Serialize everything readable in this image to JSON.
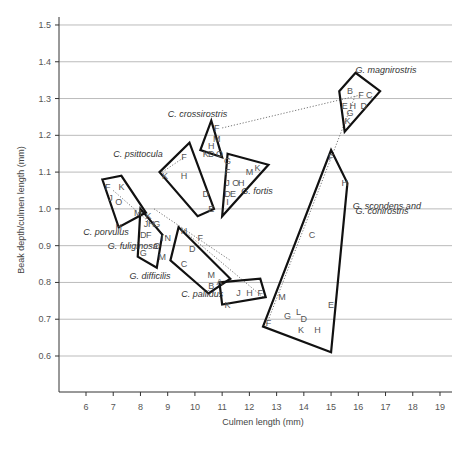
{
  "chart_data": {
    "type": "scatter",
    "title": "",
    "xlabel": "Culmen length (mm)",
    "ylabel": "Beak depth/culmen length (mm)",
    "xlim": [
      5.0,
      19.3
    ],
    "ylim": [
      0.5,
      1.52
    ],
    "x_ticks": [
      "6",
      "7",
      "8",
      "9",
      "10",
      "11",
      "12",
      "13",
      "14",
      "15",
      "16",
      "17",
      "18",
      "19"
    ],
    "y_ticks": [
      "0.6",
      "0.7",
      "0.8",
      "0.9",
      "1.0",
      "1.1",
      "1.2",
      "1.3",
      "1.4",
      "1.5"
    ],
    "grid": "horizontal",
    "series": [
      {
        "name": "G. magnirostris",
        "hull": [
          [
            15.3,
            1.32
          ],
          [
            15.9,
            1.37
          ],
          [
            16.8,
            1.32
          ],
          [
            15.5,
            1.21
          ]
        ],
        "points": [
          {
            "l": "B",
            "x": 15.7,
            "y": 1.32
          },
          {
            "l": "F",
            "x": 16.1,
            "y": 1.31
          },
          {
            "l": "C",
            "x": 16.4,
            "y": 1.31
          },
          {
            "l": "E",
            "x": 15.5,
            "y": 1.28
          },
          {
            "l": "H",
            "x": 15.8,
            "y": 1.28
          },
          {
            "l": "D",
            "x": 16.2,
            "y": 1.28
          },
          {
            "l": "G",
            "x": 15.7,
            "y": 1.26
          },
          {
            "l": "K",
            "x": 15.6,
            "y": 1.24
          }
        ]
      },
      {
        "name": "C. crossirostris",
        "hull": [
          [
            10.6,
            1.24
          ],
          [
            11.0,
            1.14
          ],
          [
            10.2,
            1.16
          ]
        ],
        "points": [
          {
            "l": "F",
            "x": 10.8,
            "y": 1.22
          },
          {
            "l": "M",
            "x": 10.8,
            "y": 1.19
          },
          {
            "l": "H",
            "x": 10.6,
            "y": 1.17
          },
          {
            "l": "K",
            "x": 10.4,
            "y": 1.15
          },
          {
            "l": "D",
            "x": 10.6,
            "y": 1.15
          },
          {
            "l": "O",
            "x": 10.9,
            "y": 1.15
          }
        ]
      },
      {
        "name": "C. psittocula",
        "hull": [
          [
            8.7,
            1.1
          ],
          [
            9.8,
            1.18
          ],
          [
            10.7,
            1.0
          ],
          [
            10.1,
            0.98
          ]
        ],
        "points": [
          {
            "l": "F",
            "x": 9.6,
            "y": 1.14
          },
          {
            "l": "K",
            "x": 8.9,
            "y": 1.09
          },
          {
            "l": "H",
            "x": 9.6,
            "y": 1.09
          },
          {
            "l": "D",
            "x": 10.4,
            "y": 1.04
          },
          {
            "l": "E",
            "x": 10.6,
            "y": 1.0
          }
        ]
      },
      {
        "name": "G. fortis",
        "hull": [
          [
            11.2,
            1.15
          ],
          [
            12.7,
            1.12
          ],
          [
            11.0,
            0.98
          ]
        ],
        "points": [
          {
            "l": "G",
            "x": 11.2,
            "y": 1.13
          },
          {
            "l": "F",
            "x": 11.2,
            "y": 1.1
          },
          {
            "l": "M",
            "x": 12.0,
            "y": 1.1
          },
          {
            "l": "K",
            "x": 12.3,
            "y": 1.11
          },
          {
            "l": "J",
            "x": 11.2,
            "y": 1.07
          },
          {
            "l": "O",
            "x": 11.5,
            "y": 1.07
          },
          {
            "l": "H",
            "x": 11.7,
            "y": 1.07
          },
          {
            "l": "D",
            "x": 11.2,
            "y": 1.04
          },
          {
            "l": "E",
            "x": 11.4,
            "y": 1.04
          },
          {
            "l": "I",
            "x": 11.2,
            "y": 1.02
          }
        ]
      },
      {
        "name": "C. porvulus",
        "hull": [
          [
            6.6,
            1.08
          ],
          [
            7.3,
            1.09
          ],
          [
            8.2,
            0.99
          ],
          [
            7.2,
            0.95
          ]
        ],
        "points": [
          {
            "l": "F",
            "x": 6.8,
            "y": 1.06
          },
          {
            "l": "K",
            "x": 7.3,
            "y": 1.06
          },
          {
            "l": "J",
            "x": 6.9,
            "y": 1.03
          },
          {
            "l": "O",
            "x": 7.2,
            "y": 1.02
          },
          {
            "l": "M",
            "x": 7.9,
            "y": 0.99
          },
          {
            "l": "H",
            "x": 7.2,
            "y": 0.95
          }
        ]
      },
      {
        "name": "G. fuliginosa",
        "hull": [
          [
            8.0,
            1.0
          ],
          [
            8.8,
            0.93
          ],
          [
            8.6,
            0.84
          ],
          [
            7.9,
            0.87
          ]
        ],
        "points": [
          {
            "l": "K",
            "x": 8.3,
            "y": 0.98
          },
          {
            "l": "J",
            "x": 8.2,
            "y": 0.96
          },
          {
            "l": "H",
            "x": 8.4,
            "y": 0.96
          },
          {
            "l": "G",
            "x": 8.6,
            "y": 0.96
          },
          {
            "l": "D",
            "x": 8.1,
            "y": 0.93
          },
          {
            "l": "F",
            "x": 8.3,
            "y": 0.93
          },
          {
            "l": "I",
            "x": 8.8,
            "y": 0.92
          },
          {
            "l": "N",
            "x": 9.0,
            "y": 0.92
          },
          {
            "l": "O",
            "x": 8.6,
            "y": 0.9
          },
          {
            "l": "G",
            "x": 8.1,
            "y": 0.88
          },
          {
            "l": "M",
            "x": 8.8,
            "y": 0.87
          }
        ]
      },
      {
        "name": "G. difficilis",
        "hull": [
          [
            9.4,
            0.95
          ],
          [
            11.3,
            0.81
          ],
          [
            10.5,
            0.77
          ],
          [
            9.1,
            0.86
          ]
        ],
        "points": [
          {
            "l": "H",
            "x": 9.6,
            "y": 0.94
          },
          {
            "l": "F",
            "x": 10.2,
            "y": 0.92
          },
          {
            "l": "D",
            "x": 9.9,
            "y": 0.89
          },
          {
            "l": "C",
            "x": 9.6,
            "y": 0.85
          },
          {
            "l": "A",
            "x": 10.9,
            "y": 0.8
          }
        ]
      },
      {
        "name": "C. pallidus",
        "hull": [
          [
            10.9,
            0.8
          ],
          [
            12.4,
            0.81
          ],
          [
            12.6,
            0.76
          ],
          [
            11.0,
            0.74
          ]
        ],
        "points": [
          {
            "l": "M",
            "x": 10.6,
            "y": 0.82
          },
          {
            "l": "B",
            "x": 10.6,
            "y": 0.79
          },
          {
            "l": "J",
            "x": 11.6,
            "y": 0.77
          },
          {
            "l": "H",
            "x": 12.0,
            "y": 0.77
          },
          {
            "l": "F",
            "x": 12.4,
            "y": 0.77
          },
          {
            "l": "K",
            "x": 11.2,
            "y": 0.74
          }
        ]
      },
      {
        "name": "G. scondens and G. conirostris",
        "hull": [
          [
            15.0,
            1.16
          ],
          [
            15.6,
            1.07
          ],
          [
            15.0,
            0.61
          ],
          [
            12.5,
            0.68
          ]
        ],
        "points": [
          {
            "l": "F",
            "x": 15.0,
            "y": 1.14
          },
          {
            "l": "H",
            "x": 15.5,
            "y": 1.07
          },
          {
            "l": "C",
            "x": 14.3,
            "y": 0.93
          },
          {
            "l": "M",
            "x": 13.2,
            "y": 0.76
          },
          {
            "l": "E",
            "x": 15.0,
            "y": 0.74
          },
          {
            "l": "L",
            "x": 13.8,
            "y": 0.72
          },
          {
            "l": "G",
            "x": 13.4,
            "y": 0.71
          },
          {
            "l": "D",
            "x": 14.0,
            "y": 0.7
          },
          {
            "l": "K",
            "x": 13.9,
            "y": 0.67
          },
          {
            "l": "H",
            "x": 14.5,
            "y": 0.67
          },
          {
            "l": "F",
            "x": 12.7,
            "y": 0.69
          }
        ]
      }
    ],
    "labels": [
      {
        "text": "G. magnirostris",
        "x": 15.9,
        "y": 1.37
      },
      {
        "text": "C. crossirostris",
        "x": 9.0,
        "y": 1.25
      },
      {
        "text": "C. psittocula",
        "x": 7.0,
        "y": 1.14
      },
      {
        "text": "G. fortis",
        "x": 11.7,
        "y": 1.04
      },
      {
        "text": "C. porvulus",
        "x": 5.9,
        "y": 0.93
      },
      {
        "text": "G. fuliginosa",
        "x": 6.8,
        "y": 0.89
      },
      {
        "text": "G. difficilis",
        "x": 7.6,
        "y": 0.81
      },
      {
        "text": "C. pallidus",
        "x": 9.5,
        "y": 0.76
      },
      {
        "text": "G. scondens and",
        "x": 15.8,
        "y": 1.0
      },
      {
        "text": "G. conirostris",
        "x": 15.9,
        "y": 0.985
      }
    ]
  }
}
